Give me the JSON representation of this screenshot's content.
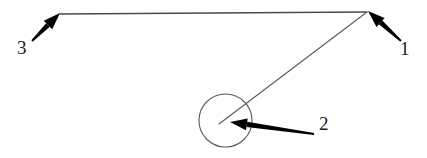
{
  "figure": {
    "background_color": "#ffffff",
    "width": 427,
    "height": 158,
    "stroke_color_thin": "#4a4a4a",
    "stroke_color_arrow": "#000000"
  },
  "callouts": [
    {
      "id": "1",
      "label": "1",
      "label_x": 400,
      "label_y": 39,
      "arrow": {
        "name": "callout-arrow-1",
        "tail_x": 401,
        "tail_y": 41,
        "tip_x": 368,
        "tip_y": 11,
        "direction": "up-left",
        "points_at": "apex-vertex"
      }
    },
    {
      "id": "2",
      "label": "2",
      "label_x": 319,
      "label_y": 114,
      "arrow": {
        "name": "callout-arrow-2",
        "tail_x": 314,
        "tail_y": 134,
        "tip_x": 230,
        "tip_y": 122,
        "direction": "left",
        "points_at": "circle-center"
      }
    },
    {
      "id": "3",
      "label": "3",
      "label_x": 17,
      "label_y": 38,
      "arrow": {
        "name": "callout-arrow-3",
        "tail_x": 32,
        "tail_y": 41,
        "tip_x": 60,
        "tip_y": 13,
        "direction": "up-right",
        "points_at": "left-endpoint"
      }
    }
  ],
  "geometry": {
    "horizontal_line": {
      "name": "horizontal-line",
      "x1": 60,
      "y1": 14,
      "x2": 367,
      "y2": 12
    },
    "diagonal_line": {
      "name": "diagonal-line",
      "x1": 367,
      "y1": 12,
      "x2": 219,
      "y2": 124
    },
    "circle": {
      "name": "circle-outline",
      "cx": 225.5,
      "cy": 120.5,
      "r": 26.5
    }
  }
}
